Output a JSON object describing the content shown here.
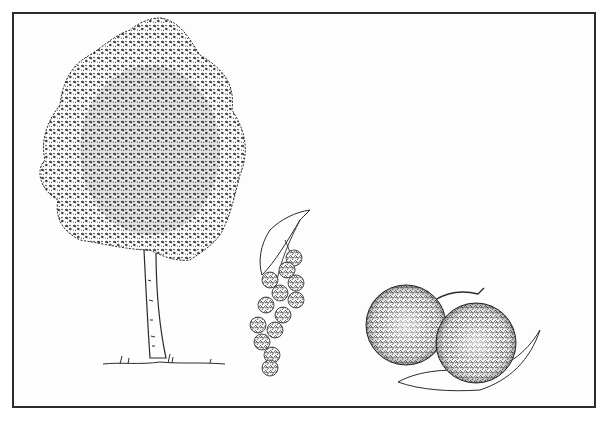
{
  "illustration": {
    "subject": "botanical pen-and-ink illustration",
    "elements": [
      {
        "name": "tree",
        "description": "deciduous tree with dense rounded crown and slender trunk"
      },
      {
        "name": "fruit-cluster",
        "description": "hanging cluster of spiky round fruits with a leaf"
      },
      {
        "name": "fruit-pair",
        "description": "two large spiky round fruits on a stem with a leaf"
      }
    ],
    "colors": {
      "ink": "#2b2b2b",
      "paper": "#fdfdfd"
    }
  },
  "caption": {
    "visible_fragment": ""
  }
}
